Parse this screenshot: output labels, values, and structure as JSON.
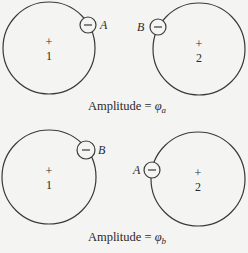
{
  "diagram": {
    "colors": {
      "line": "#3a3a3a",
      "background": "#f4f4f2",
      "text": "#2a2a2a"
    },
    "panels": [
      {
        "id": "a",
        "atoms": [
          {
            "center_label": "+",
            "number": "1",
            "cx": 49,
            "cy": 48,
            "r": 46
          },
          {
            "center_label": "+",
            "number": "2",
            "cx": 199,
            "cy": 49,
            "r": 46
          }
        ],
        "electrons": [
          {
            "sign": "−",
            "label": "A",
            "cx": 88,
            "cy": 25,
            "r": 8,
            "label_side": "right"
          },
          {
            "sign": "−",
            "label": "B",
            "cx": 158,
            "cy": 27,
            "r": 8,
            "label_side": "left"
          }
        ],
        "caption": {
          "text": "Amplitude = ",
          "symbol": "φ",
          "subscript": "a"
        }
      },
      {
        "id": "b",
        "atoms": [
          {
            "center_label": "+",
            "number": "1",
            "cx": 49,
            "cy": 177,
            "r": 47
          },
          {
            "center_label": "+",
            "number": "2",
            "cx": 198,
            "cy": 179,
            "r": 47
          }
        ],
        "electrons": [
          {
            "sign": "−",
            "label": "B",
            "cx": 86,
            "cy": 150,
            "r": 9,
            "label_side": "right"
          },
          {
            "sign": "−",
            "label": "A",
            "cx": 152,
            "cy": 170,
            "r": 8,
            "label_side": "left"
          }
        ],
        "caption": {
          "text": "Amplitude = ",
          "symbol": "φ",
          "subscript": "b"
        }
      }
    ]
  }
}
